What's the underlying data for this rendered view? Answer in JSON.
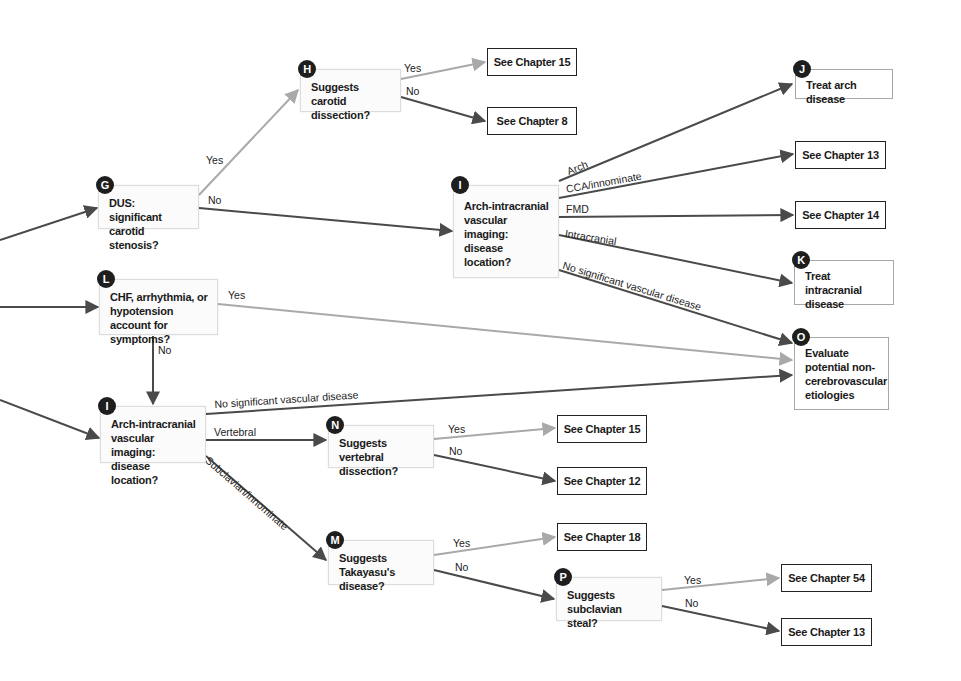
{
  "colors": {
    "dark_edge": "#4a4a4a",
    "light_edge": "#a9a9a9",
    "badge": "#1e1e1e",
    "decision_fill": "#fbfbfb",
    "decision_border": "#dcdcdc",
    "terminal_border": "#222222",
    "action_border": "#a8a8a8"
  },
  "nodes": [
    {
      "id": "G",
      "badge": "G",
      "type": "decision",
      "text": "DUS: significant carotid stenosis?",
      "x": 98,
      "y": 185,
      "w": 101,
      "h": 44
    },
    {
      "id": "H",
      "badge": "H",
      "type": "decision",
      "text": "Suggests carotid dissection?",
      "x": 300,
      "y": 69,
      "w": 101,
      "h": 43
    },
    {
      "id": "I1",
      "badge": "I",
      "type": "decision",
      "text": "Arch-intracranial vascular imaging: disease location?",
      "x": 453,
      "y": 185,
      "w": 106,
      "h": 93,
      "center": true
    },
    {
      "id": "L",
      "badge": "L",
      "type": "decision",
      "text": "CHF, arrhythmia, or hypotension account for symptoms?",
      "x": 99,
      "y": 279,
      "w": 119,
      "h": 56
    },
    {
      "id": "I2",
      "badge": "I",
      "type": "decision",
      "text": "Arch-intracranial vascular imaging: disease location?",
      "x": 100,
      "y": 406,
      "w": 106,
      "h": 57
    },
    {
      "id": "N",
      "badge": "N",
      "type": "decision",
      "text": "Suggests vertebral dissection?",
      "x": 328,
      "y": 425,
      "w": 106,
      "h": 43
    },
    {
      "id": "M",
      "badge": "M",
      "type": "decision",
      "text": "Suggests Takayasu's disease?",
      "x": 328,
      "y": 540,
      "w": 106,
      "h": 45
    },
    {
      "id": "P",
      "badge": "P",
      "type": "decision",
      "text": "Suggests subclavian steal?",
      "x": 556,
      "y": 577,
      "w": 106,
      "h": 44
    },
    {
      "id": "J",
      "badge": "J",
      "type": "action",
      "text": "Treat arch disease",
      "x": 795,
      "y": 69,
      "w": 98,
      "h": 30
    },
    {
      "id": "K",
      "badge": "K",
      "type": "action",
      "text": "Treat intracranial disease",
      "x": 794,
      "y": 260,
      "w": 100,
      "h": 45
    },
    {
      "id": "O",
      "badge": "O",
      "type": "action",
      "text": "Evaluate potential non-cerebrovascular etiologies",
      "x": 794,
      "y": 337,
      "w": 95,
      "h": 73
    },
    {
      "id": "C15a",
      "type": "terminal",
      "text": "See Chapter 15",
      "x": 487,
      "y": 48,
      "w": 90,
      "h": 28
    },
    {
      "id": "C8",
      "type": "terminal",
      "text": "See Chapter 8",
      "x": 487,
      "y": 107,
      "w": 90,
      "h": 28
    },
    {
      "id": "C13a",
      "type": "terminal",
      "text": "See Chapter 13",
      "x": 795,
      "y": 141,
      "w": 91,
      "h": 28
    },
    {
      "id": "C14",
      "type": "terminal",
      "text": "See Chapter 14",
      "x": 795,
      "y": 201,
      "w": 91,
      "h": 28
    },
    {
      "id": "C15b",
      "type": "terminal",
      "text": "See Chapter 15",
      "x": 557,
      "y": 415,
      "w": 90,
      "h": 28
    },
    {
      "id": "C12",
      "type": "terminal",
      "text": "See Chapter 12",
      "x": 557,
      "y": 467,
      "w": 90,
      "h": 28
    },
    {
      "id": "C18",
      "type": "terminal",
      "text": "See Chapter 18",
      "x": 557,
      "y": 523,
      "w": 90,
      "h": 28
    },
    {
      "id": "C54",
      "type": "terminal",
      "text": "See Chapter 54",
      "x": 781,
      "y": 564,
      "w": 91,
      "h": 28
    },
    {
      "id": "C13b",
      "type": "terminal",
      "text": "See Chapter 13",
      "x": 781,
      "y": 618,
      "w": 91,
      "h": 28
    }
  ],
  "edges": [
    {
      "from": "entry",
      "to": "G",
      "x1": 0,
      "y1": 240,
      "x2": 97,
      "y2": 208,
      "tone": "dark",
      "label": ""
    },
    {
      "from": "entry",
      "to": "L",
      "x1": 0,
      "y1": 307,
      "x2": 98,
      "y2": 307,
      "tone": "dark",
      "label": ""
    },
    {
      "from": "entry",
      "to": "I2",
      "x1": 0,
      "y1": 400,
      "x2": 99,
      "y2": 438,
      "tone": "dark",
      "label": ""
    },
    {
      "from": "G",
      "to": "H",
      "x1": 199,
      "y1": 195,
      "x2": 298,
      "y2": 90,
      "tone": "light",
      "label": "Yes",
      "lx": 206,
      "ly": 154,
      "rot": 0
    },
    {
      "from": "G",
      "to": "I1",
      "x1": 199,
      "y1": 208,
      "x2": 452,
      "y2": 231,
      "tone": "dark",
      "label": "No",
      "lx": 208,
      "ly": 194,
      "rot": 0
    },
    {
      "from": "H",
      "to": "C15a",
      "x1": 401,
      "y1": 79,
      "x2": 485,
      "y2": 62,
      "tone": "light",
      "label": "Yes",
      "lx": 404,
      "ly": 62,
      "rot": 0
    },
    {
      "from": "H",
      "to": "C8",
      "x1": 401,
      "y1": 97,
      "x2": 485,
      "y2": 121,
      "tone": "dark",
      "label": "No",
      "lx": 406,
      "ly": 85,
      "rot": 0
    },
    {
      "from": "I1",
      "to": "J",
      "x1": 559,
      "y1": 181,
      "x2": 792,
      "y2": 84,
      "tone": "dark",
      "label": "Arch",
      "lx": 565,
      "ly": 166,
      "rot": -22
    },
    {
      "from": "I1",
      "to": "C13a",
      "x1": 559,
      "y1": 198,
      "x2": 793,
      "y2": 154,
      "tone": "dark",
      "label": "CCA/innominate",
      "lx": 565,
      "ly": 183,
      "rot": -10
    },
    {
      "from": "I1",
      "to": "C14",
      "x1": 559,
      "y1": 217,
      "x2": 793,
      "y2": 215,
      "tone": "dark",
      "label": "FMD",
      "lx": 566,
      "ly": 203,
      "rot": 0
    },
    {
      "from": "I1",
      "to": "K",
      "x1": 559,
      "y1": 235,
      "x2": 792,
      "y2": 283,
      "tone": "dark",
      "label": "Intracranial",
      "lx": 566,
      "ly": 227,
      "rot": 9
    },
    {
      "from": "I1",
      "to": "O",
      "x1": 559,
      "y1": 270,
      "x2": 792,
      "y2": 343,
      "tone": "dark",
      "label": "No significant vascular disease",
      "lx": 565,
      "ly": 259,
      "rot": 17
    },
    {
      "from": "L",
      "to": "O",
      "x1": 218,
      "y1": 304,
      "x2": 792,
      "y2": 360,
      "tone": "light",
      "label": "Yes",
      "lx": 228,
      "ly": 289,
      "rot": 0
    },
    {
      "from": "L",
      "to": "I2",
      "x1": 153,
      "y1": 336,
      "x2": 153,
      "y2": 404,
      "tone": "dark",
      "label": "No",
      "lx": 158,
      "ly": 344,
      "rot": 0
    },
    {
      "from": "I2",
      "to": "O",
      "x1": 206,
      "y1": 414,
      "x2": 792,
      "y2": 375,
      "tone": "dark",
      "label": "No significant vascular disease",
      "lx": 214,
      "ly": 398,
      "rot": -3.8
    },
    {
      "from": "I2",
      "to": "N",
      "x1": 206,
      "y1": 440,
      "x2": 326,
      "y2": 440,
      "tone": "dark",
      "label": "Vertebral",
      "lx": 214,
      "ly": 426,
      "rot": 0
    },
    {
      "from": "I2",
      "to": "M",
      "x1": 206,
      "y1": 456,
      "x2": 326,
      "y2": 560,
      "tone": "dark",
      "label": "Subclavian/innominate",
      "lx": 211,
      "ly": 454,
      "rot": 41
    },
    {
      "from": "N",
      "to": "C15b",
      "x1": 434,
      "y1": 439,
      "x2": 555,
      "y2": 428,
      "tone": "light",
      "label": "Yes",
      "lx": 448,
      "ly": 423,
      "rot": 0
    },
    {
      "from": "N",
      "to": "C12",
      "x1": 434,
      "y1": 455,
      "x2": 555,
      "y2": 481,
      "tone": "dark",
      "label": "No",
      "lx": 449,
      "ly": 445,
      "rot": 0
    },
    {
      "from": "M",
      "to": "C18",
      "x1": 434,
      "y1": 555,
      "x2": 555,
      "y2": 537,
      "tone": "light",
      "label": "Yes",
      "lx": 453,
      "ly": 537,
      "rot": 0
    },
    {
      "from": "M",
      "to": "P",
      "x1": 434,
      "y1": 570,
      "x2": 554,
      "y2": 599,
      "tone": "dark",
      "label": "No",
      "lx": 455,
      "ly": 561,
      "rot": 0
    },
    {
      "from": "P",
      "to": "C54",
      "x1": 662,
      "y1": 590,
      "x2": 779,
      "y2": 578,
      "tone": "light",
      "label": "Yes",
      "lx": 684,
      "ly": 574,
      "rot": 0
    },
    {
      "from": "P",
      "to": "C13b",
      "x1": 662,
      "y1": 606,
      "x2": 779,
      "y2": 631,
      "tone": "dark",
      "label": "No",
      "lx": 685,
      "ly": 597,
      "rot": 0
    }
  ]
}
